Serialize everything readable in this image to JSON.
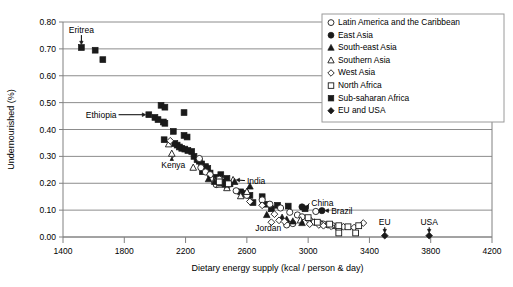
{
  "chart_data": {
    "type": "scatter",
    "title": "",
    "xlabel": "Dietary energy supply (kcal / person & day)",
    "ylabel": "Undernourished (%)",
    "xlim": [
      1400,
      4200
    ],
    "ylim": [
      0.0,
      0.8
    ],
    "xticks": [
      1400,
      1800,
      2200,
      2600,
      3000,
      3400,
      3800,
      4200
    ],
    "xtick_labels": [
      "1400",
      "1800",
      "2200",
      "2600",
      "3000",
      "3400",
      "3800",
      "4200"
    ],
    "yticks": [
      0.0,
      0.1,
      0.2,
      0.3,
      0.4,
      0.5,
      0.6,
      0.7,
      0.8
    ],
    "ytick_labels": [
      "0.00",
      "0.10",
      "0.20",
      "0.30",
      "0.40",
      "0.50",
      "0.60",
      "0.70",
      "0.80"
    ],
    "grid": "horizontal",
    "legend_position": "top-right",
    "legend_entries": [
      {
        "name": "Latin America and the Caribbean",
        "marker": "circle-open"
      },
      {
        "name": "East Asia",
        "marker": "circle-filled"
      },
      {
        "name": "South-east Asia",
        "marker": "triangle-filled"
      },
      {
        "name": "Southern Asia",
        "marker": "triangle-open"
      },
      {
        "name": "West Asia",
        "marker": "diamond-open"
      },
      {
        "name": "North Africa",
        "marker": "square-open"
      },
      {
        "name": "Sub-saharan Africa",
        "marker": "square-filled"
      },
      {
        "name": "EU and USA",
        "marker": "diamond-filled"
      }
    ],
    "series": [
      {
        "name": "Sub-saharan Africa",
        "marker": "square-filled",
        "points": [
          [
            1520,
            0.705
          ],
          [
            1610,
            0.695
          ],
          [
            1660,
            0.66
          ],
          [
            2040,
            0.49
          ],
          [
            2065,
            0.483
          ],
          [
            1960,
            0.455
          ],
          [
            2000,
            0.445
          ],
          [
            2020,
            0.437
          ],
          [
            2055,
            0.428
          ],
          [
            2065,
            0.423
          ],
          [
            2190,
            0.463
          ],
          [
            2120,
            0.393
          ],
          [
            2190,
            0.378
          ],
          [
            2210,
            0.372
          ],
          [
            2060,
            0.362
          ],
          [
            2130,
            0.348
          ],
          [
            2145,
            0.342
          ],
          [
            2160,
            0.335
          ],
          [
            2175,
            0.33
          ],
          [
            2195,
            0.327
          ],
          [
            2215,
            0.322
          ],
          [
            2240,
            0.318
          ],
          [
            2255,
            0.3
          ],
          [
            2275,
            0.288
          ],
          [
            2290,
            0.282
          ],
          [
            2305,
            0.272
          ],
          [
            2330,
            0.262
          ],
          [
            2345,
            0.255
          ],
          [
            2310,
            0.243
          ],
          [
            2360,
            0.238
          ],
          [
            2430,
            0.232
          ],
          [
            2400,
            0.222
          ],
          [
            2470,
            0.218
          ],
          [
            2440,
            0.205
          ],
          [
            2490,
            0.198
          ],
          [
            2560,
            0.168
          ],
          [
            2590,
            0.162
          ],
          [
            2620,
            0.155
          ],
          [
            2700,
            0.15
          ],
          [
            2640,
            0.128
          ],
          [
            2730,
            0.122
          ],
          [
            2800,
            0.118
          ],
          [
            2870,
            0.115
          ],
          [
            2760,
            0.105
          ],
          [
            2980,
            0.105
          ]
        ]
      },
      {
        "name": "Latin America and the Caribbean",
        "marker": "circle-open",
        "points": [
          [
            2290,
            0.292
          ],
          [
            2300,
            0.258
          ],
          [
            2330,
            0.242
          ],
          [
            2360,
            0.232
          ],
          [
            2420,
            0.215
          ],
          [
            2400,
            0.195
          ],
          [
            2470,
            0.188
          ],
          [
            2530,
            0.172
          ],
          [
            2600,
            0.155
          ],
          [
            2700,
            0.138
          ],
          [
            2750,
            0.122
          ],
          [
            2820,
            0.108
          ],
          [
            2880,
            0.092
          ],
          [
            2930,
            0.082
          ],
          [
            2960,
            0.075
          ],
          [
            3010,
            0.062
          ],
          [
            3040,
            0.055
          ],
          [
            3070,
            0.052
          ],
          [
            3100,
            0.048
          ],
          [
            3130,
            0.045
          ],
          [
            3160,
            0.042
          ],
          [
            3190,
            0.038
          ],
          [
            2900,
            0.05
          ],
          [
            3050,
            0.095
          ],
          [
            3200,
            0.032
          ],
          [
            2860,
            0.045
          ]
        ]
      },
      {
        "name": "Southern Asia",
        "marker": "triangle-open",
        "points": [
          [
            2090,
            0.345
          ],
          [
            2110,
            0.31
          ],
          [
            2250,
            0.258
          ],
          [
            2390,
            0.21
          ],
          [
            2420,
            0.195
          ],
          [
            2470,
            0.182
          ],
          [
            2510,
            0.212
          ],
          [
            2600,
            0.168
          ],
          [
            2950,
            0.062
          ],
          [
            3090,
            0.048
          ],
          [
            2560,
            0.152
          ]
        ]
      },
      {
        "name": "South-east Asia",
        "marker": "triangle-filled",
        "points": [
          [
            2350,
            0.215
          ],
          [
            2390,
            0.205
          ],
          [
            2430,
            0.2
          ],
          [
            2460,
            0.195
          ],
          [
            2520,
            0.205
          ],
          [
            2620,
            0.188
          ],
          [
            2730,
            0.082
          ],
          [
            2830,
            0.072
          ],
          [
            2860,
            0.065
          ],
          [
            2900,
            0.058
          ],
          [
            2960,
            0.052
          ]
        ]
      },
      {
        "name": "West Asia",
        "marker": "diamond-open",
        "points": [
          [
            2100,
            0.358
          ],
          [
            2620,
            0.132
          ],
          [
            2700,
            0.118
          ],
          [
            2780,
            0.085
          ],
          [
            2810,
            0.062
          ],
          [
            2845,
            0.058
          ],
          [
            3010,
            0.048
          ],
          [
            3070,
            0.045
          ],
          [
            3100,
            0.042
          ],
          [
            3150,
            0.04
          ],
          [
            3230,
            0.038
          ],
          [
            3300,
            0.035
          ],
          [
            3360,
            0.052
          ],
          [
            2760,
            0.055
          ]
        ]
      },
      {
        "name": "North Africa",
        "marker": "square-open",
        "points": [
          [
            2420,
            0.205
          ],
          [
            2480,
            0.198
          ],
          [
            3000,
            0.072
          ],
          [
            3060,
            0.055
          ],
          [
            3140,
            0.048
          ],
          [
            3200,
            0.042
          ],
          [
            3260,
            0.038
          ],
          [
            3330,
            0.042
          ],
          [
            3200,
            0.015
          ],
          [
            3310,
            0.015
          ]
        ]
      },
      {
        "name": "East Asia",
        "marker": "circle-filled",
        "points": [
          [
            2960,
            0.112
          ],
          [
            3090,
            0.098
          ]
        ]
      },
      {
        "name": "EU and USA",
        "marker": "diamond-filled",
        "points": [
          [
            3500,
            0.005
          ],
          [
            3790,
            0.005
          ]
        ]
      }
    ],
    "annotations": [
      {
        "label": "Eritrea",
        "text_xy": [
          1520,
          0.77
        ],
        "point_xy": [
          1520,
          0.705
        ],
        "arrow": "down"
      },
      {
        "label": "Ethiopia",
        "text_xy": [
          1730,
          0.455
        ],
        "point_xy": [
          1960,
          0.455
        ],
        "arrow": "right"
      },
      {
        "label": "Kenya",
        "text_xy": [
          2120,
          0.268
        ],
        "point_xy": [
          2110,
          0.31
        ],
        "arrow": "up"
      },
      {
        "label": "India",
        "text_xy": [
          2620,
          0.21
        ],
        "point_xy": [
          2510,
          0.212
        ],
        "arrow": "left"
      },
      {
        "label": "Jordan",
        "text_xy": [
          2740,
          0.035
        ],
        "point_xy": [
          2810,
          0.062
        ],
        "arrow": "none"
      },
      {
        "label": "China",
        "text_xy": [
          3040,
          0.125
        ],
        "point_xy": [
          2960,
          0.112
        ],
        "arrow": "left"
      },
      {
        "label": "Brazil",
        "text_xy": [
          3170,
          0.098
        ],
        "point_xy": [
          3090,
          0.098
        ],
        "arrow": "left"
      },
      {
        "label": "EU",
        "text_xy": [
          3500,
          0.055
        ],
        "point_xy": [
          3500,
          0.005
        ],
        "arrow": "down"
      },
      {
        "label": "USA",
        "text_xy": [
          3790,
          0.055
        ],
        "point_xy": [
          3790,
          0.005
        ],
        "arrow": "down"
      }
    ]
  }
}
